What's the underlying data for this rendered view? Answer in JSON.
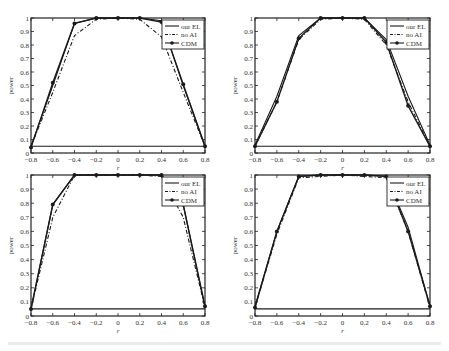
{
  "chart_data": [
    {
      "type": "line",
      "panel": "top-left",
      "title": "",
      "xlabel": "r",
      "ylabel": "power",
      "x": [
        -0.8,
        -0.6,
        -0.4,
        -0.2,
        0,
        0.2,
        0.4,
        0.6,
        0.8
      ],
      "xlim": [
        -0.8,
        0.8
      ],
      "ylim": [
        0,
        1
      ],
      "xticks": [
        "-0.8",
        "-0.6",
        "-0.4",
        "-0.2",
        "0",
        "0.2",
        "0.4",
        "0.6",
        "0.8"
      ],
      "yticks": [
        "0",
        "0.1",
        "0.2",
        "0.3",
        "0.4",
        "0.5",
        "0.6",
        "0.7",
        "0.8",
        "0.9",
        "1"
      ],
      "reference_line": 0.05,
      "grid": false,
      "legend_position": "upper right",
      "series": [
        {
          "name": "our EL",
          "style": "solid",
          "values": [
            0.05,
            0.5,
            0.96,
            1.0,
            1.0,
            1.0,
            0.98,
            0.5,
            0.05
          ]
        },
        {
          "name": "no AI",
          "style": "dashdot",
          "values": [
            0.05,
            0.45,
            0.87,
            0.99,
            1.0,
            0.99,
            0.86,
            0.45,
            0.05
          ]
        },
        {
          "name": "CDM",
          "style": "solid-marker",
          "values": [
            0.04,
            0.52,
            0.96,
            1.0,
            1.0,
            1.0,
            0.97,
            0.51,
            0.05
          ]
        }
      ]
    },
    {
      "type": "line",
      "panel": "top-right",
      "title": "",
      "xlabel": "r",
      "ylabel": "power",
      "x": [
        -0.8,
        -0.6,
        -0.4,
        -0.2,
        0,
        0.2,
        0.4,
        0.6,
        0.8
      ],
      "xlim": [
        -0.8,
        0.8
      ],
      "ylim": [
        0,
        1
      ],
      "xticks": [
        "-0.8",
        "-0.6",
        "-0.4",
        "-0.2",
        "0",
        "0.2",
        "0.4",
        "0.6",
        "0.8"
      ],
      "yticks": [
        "0",
        "0.1",
        "0.2",
        "0.3",
        "0.4",
        "0.5",
        "0.6",
        "0.7",
        "0.8",
        "0.9",
        "1"
      ],
      "reference_line": 0.05,
      "grid": false,
      "legend_position": "upper right",
      "series": [
        {
          "name": "our EL",
          "style": "solid",
          "values": [
            0.06,
            0.42,
            0.87,
            1.0,
            1.0,
            1.0,
            0.84,
            0.42,
            0.06
          ]
        },
        {
          "name": "no AI",
          "style": "dashdot",
          "values": [
            0.05,
            0.38,
            0.84,
            0.99,
            1.0,
            0.99,
            0.8,
            0.38,
            0.05
          ]
        },
        {
          "name": "CDM",
          "style": "solid-marker",
          "values": [
            0.05,
            0.38,
            0.85,
            1.0,
            1.0,
            1.0,
            0.82,
            0.35,
            0.05
          ]
        }
      ]
    },
    {
      "type": "line",
      "panel": "bottom-left",
      "title": "",
      "xlabel": "r",
      "ylabel": "power",
      "x": [
        -0.8,
        -0.6,
        -0.4,
        -0.2,
        0,
        0.2,
        0.4,
        0.6,
        0.8
      ],
      "xlim": [
        -0.8,
        0.8
      ],
      "ylim": [
        0,
        1
      ],
      "xticks": [
        "-0.8",
        "-0.6",
        "-0.4",
        "-0.2",
        "0",
        "0.2",
        "0.4",
        "0.6",
        "0.8"
      ],
      "yticks": [
        "0",
        "0.1",
        "0.2",
        "0.3",
        "0.4",
        "0.5",
        "0.6",
        "0.7",
        "0.8",
        "0.9",
        "1"
      ],
      "reference_line": 0.05,
      "grid": false,
      "legend_position": "upper right",
      "series": [
        {
          "name": "our EL",
          "style": "solid",
          "values": [
            0.05,
            0.79,
            1.0,
            1.0,
            1.0,
            1.0,
            1.0,
            0.79,
            0.06
          ]
        },
        {
          "name": "no AI",
          "style": "dashdot",
          "values": [
            0.05,
            0.7,
            1.0,
            1.0,
            1.0,
            1.0,
            0.99,
            0.7,
            0.06
          ]
        },
        {
          "name": "CDM",
          "style": "solid-marker",
          "values": [
            0.05,
            0.79,
            1.0,
            1.0,
            1.0,
            1.0,
            1.0,
            0.79,
            0.07
          ]
        }
      ]
    },
    {
      "type": "line",
      "panel": "bottom-right",
      "title": "",
      "xlabel": "r",
      "ylabel": "power",
      "x": [
        -0.8,
        -0.6,
        -0.4,
        -0.2,
        0,
        0.2,
        0.4,
        0.6,
        0.8
      ],
      "xlim": [
        -0.8,
        0.8
      ],
      "ylim": [
        0,
        1
      ],
      "xticks": [
        "-0.8",
        "-0.6",
        "-0.4",
        "-0.2",
        "0",
        "0.2",
        "0.4",
        "0.6",
        "0.8"
      ],
      "yticks": [
        "0",
        "0.1",
        "0.2",
        "0.3",
        "0.4",
        "0.5",
        "0.6",
        "0.7",
        "0.8",
        "0.9",
        "1"
      ],
      "reference_line": 0.05,
      "grid": false,
      "legend_position": "upper right",
      "series": [
        {
          "name": "our EL",
          "style": "solid",
          "values": [
            0.07,
            0.6,
            0.99,
            1.0,
            1.0,
            1.0,
            0.99,
            0.63,
            0.07
          ]
        },
        {
          "name": "no AI",
          "style": "dashdot",
          "values": [
            0.06,
            0.58,
            0.98,
            0.99,
            1.0,
            0.99,
            0.98,
            0.6,
            0.06
          ]
        },
        {
          "name": "CDM",
          "style": "solid-marker",
          "values": [
            0.06,
            0.6,
            0.99,
            1.0,
            1.0,
            1.0,
            0.99,
            0.6,
            0.07
          ]
        }
      ]
    }
  ],
  "layout": {
    "panels": [
      {
        "x0": 31,
        "x1": 205,
        "y1": 18,
        "y0": 153
      },
      {
        "x0": 255,
        "x1": 430,
        "y1": 18,
        "y0": 153
      },
      {
        "x0": 31,
        "x1": 205,
        "y1": 175,
        "y0": 316
      },
      {
        "x0": 255,
        "x1": 430,
        "y1": 175,
        "y0": 316
      }
    ]
  },
  "colors": {
    "line": "#1a1a1a",
    "axis": "#222222",
    "text": "#333333",
    "background": "#ffffff"
  }
}
